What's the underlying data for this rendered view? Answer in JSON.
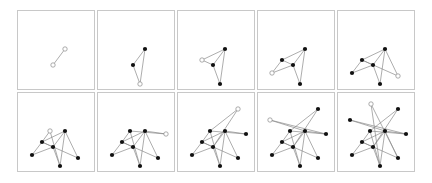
{
  "figure": {
    "rows": 2,
    "columns": 5,
    "colors": {
      "edge": "#8a8a8a",
      "node_filled": "#111111",
      "node_new_fill": "#ffffff",
      "panel_border": "#c8c8c8"
    },
    "nodes": {
      "T": [
        33,
        11
      ],
      "A": [
        60,
        16
      ],
      "B": [
        12,
        27
      ],
      "C": [
        32,
        38
      ],
      "D": [
        47,
        38
      ],
      "E": [
        68,
        41
      ],
      "F": [
        24,
        49
      ],
      "G": [
        35,
        54
      ],
      "H": [
        14,
        62
      ],
      "I": [
        60,
        65
      ],
      "J": [
        42,
        73
      ]
    },
    "panels": [
      {
        "step": 1,
        "new_node": [
          "D",
          "G"
        ],
        "nodes": [
          "D",
          "G"
        ],
        "edges": [
          [
            "D",
            "G"
          ]
        ]
      },
      {
        "step": 2,
        "new_node": [
          "J"
        ],
        "nodes": [
          "D",
          "G",
          "J"
        ],
        "edges": [
          [
            "D",
            "G"
          ],
          [
            "D",
            "J"
          ],
          [
            "G",
            "J"
          ]
        ]
      },
      {
        "step": 3,
        "new_node": [
          "F"
        ],
        "nodes": [
          "D",
          "G",
          "J",
          "F"
        ],
        "edges": [
          [
            "D",
            "G"
          ],
          [
            "D",
            "J"
          ],
          [
            "G",
            "J"
          ],
          [
            "F",
            "D"
          ],
          [
            "F",
            "G"
          ]
        ]
      },
      {
        "step": 4,
        "new_node": [
          "H"
        ],
        "nodes": [
          "D",
          "G",
          "J",
          "F",
          "H"
        ],
        "edges": [
          [
            "D",
            "G"
          ],
          [
            "D",
            "J"
          ],
          [
            "G",
            "J"
          ],
          [
            "F",
            "D"
          ],
          [
            "F",
            "G"
          ],
          [
            "H",
            "F"
          ],
          [
            "H",
            "G"
          ]
        ]
      },
      {
        "step": 5,
        "new_node": [
          "I"
        ],
        "nodes": [
          "D",
          "G",
          "J",
          "F",
          "H",
          "I"
        ],
        "edges": [
          [
            "D",
            "G"
          ],
          [
            "D",
            "J"
          ],
          [
            "G",
            "J"
          ],
          [
            "F",
            "D"
          ],
          [
            "F",
            "G"
          ],
          [
            "H",
            "F"
          ],
          [
            "H",
            "G"
          ],
          [
            "I",
            "D"
          ],
          [
            "I",
            "F"
          ]
        ]
      },
      {
        "step": 6,
        "new_node": [
          "C"
        ],
        "nodes": [
          "D",
          "G",
          "J",
          "F",
          "H",
          "I",
          "C"
        ],
        "edges": [
          [
            "D",
            "G"
          ],
          [
            "D",
            "J"
          ],
          [
            "G",
            "J"
          ],
          [
            "F",
            "D"
          ],
          [
            "F",
            "G"
          ],
          [
            "H",
            "F"
          ],
          [
            "H",
            "G"
          ],
          [
            "I",
            "D"
          ],
          [
            "I",
            "F"
          ],
          [
            "C",
            "F"
          ],
          [
            "C",
            "J"
          ]
        ]
      },
      {
        "step": 7,
        "new_node": [
          "E"
        ],
        "nodes": [
          "D",
          "G",
          "J",
          "F",
          "H",
          "I",
          "C",
          "E"
        ],
        "edges": [
          [
            "D",
            "G"
          ],
          [
            "D",
            "J"
          ],
          [
            "G",
            "J"
          ],
          [
            "F",
            "D"
          ],
          [
            "F",
            "G"
          ],
          [
            "H",
            "F"
          ],
          [
            "H",
            "G"
          ],
          [
            "I",
            "D"
          ],
          [
            "I",
            "F"
          ],
          [
            "C",
            "F"
          ],
          [
            "C",
            "J"
          ],
          [
            "E",
            "D"
          ],
          [
            "E",
            "C"
          ]
        ]
      },
      {
        "step": 8,
        "new_node": [
          "A"
        ],
        "nodes": [
          "D",
          "G",
          "J",
          "F",
          "H",
          "I",
          "C",
          "E",
          "A"
        ],
        "edges": [
          [
            "D",
            "G"
          ],
          [
            "D",
            "J"
          ],
          [
            "G",
            "J"
          ],
          [
            "F",
            "D"
          ],
          [
            "F",
            "G"
          ],
          [
            "H",
            "F"
          ],
          [
            "H",
            "G"
          ],
          [
            "I",
            "D"
          ],
          [
            "I",
            "F"
          ],
          [
            "C",
            "F"
          ],
          [
            "C",
            "J"
          ],
          [
            "E",
            "D"
          ],
          [
            "E",
            "C"
          ],
          [
            "A",
            "C"
          ],
          [
            "A",
            "G"
          ]
        ]
      },
      {
        "step": 9,
        "new_node": [
          "B"
        ],
        "nodes": [
          "D",
          "G",
          "J",
          "F",
          "H",
          "I",
          "C",
          "E",
          "A",
          "B"
        ],
        "edges": [
          [
            "D",
            "G"
          ],
          [
            "D",
            "J"
          ],
          [
            "G",
            "J"
          ],
          [
            "F",
            "D"
          ],
          [
            "F",
            "G"
          ],
          [
            "H",
            "F"
          ],
          [
            "H",
            "G"
          ],
          [
            "I",
            "D"
          ],
          [
            "I",
            "F"
          ],
          [
            "C",
            "F"
          ],
          [
            "C",
            "J"
          ],
          [
            "E",
            "D"
          ],
          [
            "E",
            "C"
          ],
          [
            "A",
            "C"
          ],
          [
            "A",
            "G"
          ],
          [
            "B",
            "D"
          ],
          [
            "B",
            "E"
          ]
        ]
      },
      {
        "step": 10,
        "new_node": [
          "T"
        ],
        "nodes": [
          "D",
          "G",
          "J",
          "F",
          "H",
          "I",
          "C",
          "E",
          "A",
          "B",
          "T"
        ],
        "edges": [
          [
            "D",
            "G"
          ],
          [
            "D",
            "J"
          ],
          [
            "G",
            "J"
          ],
          [
            "F",
            "D"
          ],
          [
            "F",
            "G"
          ],
          [
            "H",
            "F"
          ],
          [
            "H",
            "G"
          ],
          [
            "I",
            "D"
          ],
          [
            "I",
            "F"
          ],
          [
            "C",
            "F"
          ],
          [
            "C",
            "J"
          ],
          [
            "E",
            "D"
          ],
          [
            "E",
            "C"
          ],
          [
            "A",
            "C"
          ],
          [
            "A",
            "G"
          ],
          [
            "B",
            "D"
          ],
          [
            "B",
            "E"
          ],
          [
            "T",
            "J"
          ],
          [
            "T",
            "I"
          ]
        ]
      }
    ]
  }
}
